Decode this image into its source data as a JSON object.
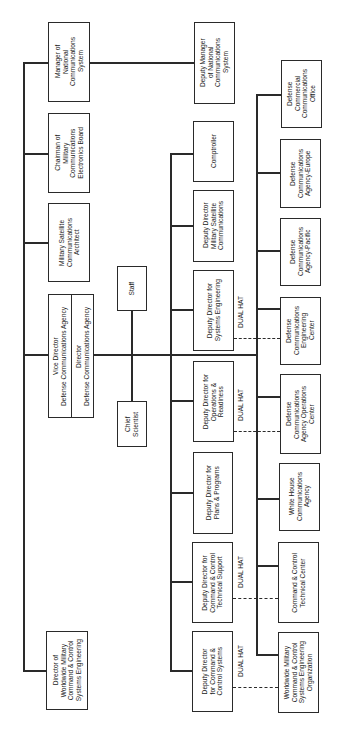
{
  "chart_title": "",
  "left_column": {
    "manager_ncs": "Manager of\nNational\nCommunications\nSystem",
    "chairman_mceb": "Chairman of\nMilitary\nCommunications\nElectronics Board",
    "mil_sat_architect": "Military Satellite\nCommunications\nArchitect",
    "director_dca": "Director\nDefense Communications Agency",
    "vice_director_dca": "Vice Director\nDefense Communications Agency",
    "director_wwmccs_eng": "Director of\nWorldwide Military\nCommand & Control\nSystems Engineering"
  },
  "staff_column": {
    "staff": "Staff",
    "chief_scientist": "Chief\nScientist"
  },
  "middle_column": {
    "deputy_manager_ncs": "Deputy Manager\nof National\nCommunications\nSystem",
    "comptroller": "Comptroller",
    "dd_mil_sat": "Deputy Director\nMilitary Satellite\nCommunications",
    "dd_sys_eng": "Deputy Director for\nSystems Engineering",
    "dd_ops_readiness": "Deputy Director for\nOperations &\nReadiness",
    "dd_plans_programs": "Deputy Director for\nPlans & Programs",
    "dd_cc_tech_support": "Deputy Director for\nCommand & Control\nTechnical Support",
    "dd_cc_systems": "Deputy Director\nfor Command &\nControl Systems"
  },
  "right_column": {
    "dcco": "Defense\nCommercial\nCommunications\nOffice",
    "dca_europe": "Defense\nCommunications\nAgency-Europe",
    "dca_pacific": "Defense\nCommunications\nAgency-Pacific",
    "dcec": "Defense\nCommunications\nEngineering\nCenter",
    "dca_ops_center": "Defense\nCommunications\nAgency Operations\nCenter",
    "whca": "White House\nCommunications\nAgency",
    "cctc": "Command & Control\nTechnical Center",
    "wwmccs_seo": "Worldwide Military\nCommand & Control\nSystems Engineering\nOrganization"
  },
  "dual_hat_label": "DUAL HAT",
  "colors": {
    "line": "#2a2a2a",
    "background": "#ffffff"
  }
}
